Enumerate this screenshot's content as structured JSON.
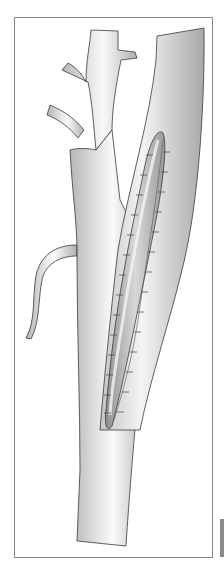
{
  "figure": {
    "colors": {
      "background": "#ffffff",
      "frame": "#8a8a8a",
      "vessel_light": "#f2f2f2",
      "vessel_shade": "#b8b8b8",
      "outline": "#3a3a3a",
      "patch": "#a9a9a9",
      "side_tab": "#8c8c8c"
    }
  }
}
